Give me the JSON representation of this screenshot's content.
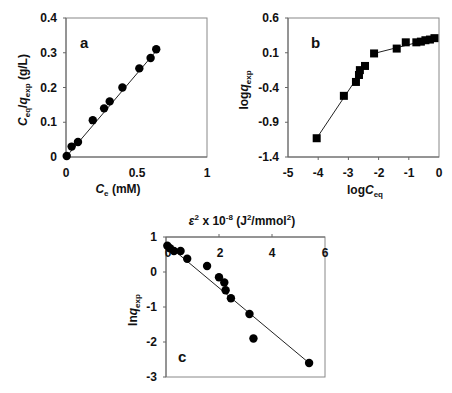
{
  "chart_data": [
    {
      "id": "a",
      "type": "scatter",
      "panel_label": "a",
      "xlabel": "C_e (mM)",
      "ylabel": "C_eq/q_exp (g/L)",
      "xlim": [
        0,
        1
      ],
      "ylim": [
        0,
        0.4
      ],
      "xticks": [
        "0",
        "0.5",
        "1"
      ],
      "yticks": [
        "0",
        "0.1",
        "0.2",
        "0.3",
        "0.4"
      ],
      "grid": false,
      "marker": "circle",
      "x": [
        0.005,
        0.04,
        0.085,
        0.19,
        0.27,
        0.31,
        0.4,
        0.52,
        0.6,
        0.64
      ],
      "y": [
        0.003,
        0.03,
        0.043,
        0.106,
        0.14,
        0.16,
        0.2,
        0.255,
        0.285,
        0.31
      ],
      "fit_line": {
        "x": [
          0,
          0.65
        ],
        "y": [
          0.0,
          0.31
        ]
      }
    },
    {
      "id": "b",
      "type": "line",
      "panel_label": "b",
      "xlabel": "logC_eq",
      "ylabel": "logq_exp",
      "xlim": [
        -5,
        0
      ],
      "ylim": [
        -1.4,
        0.6
      ],
      "xticks": [
        "-5",
        "-4",
        "-3",
        "-2",
        "-1",
        "0"
      ],
      "yticks": [
        "-1.4",
        "-0.9",
        "-0.4",
        "0.1",
        "0.6"
      ],
      "grid": false,
      "marker": "square",
      "x": [
        -4.05,
        -3.15,
        -2.75,
        -2.65,
        -2.62,
        -2.45,
        -2.15,
        -1.4,
        -1.1,
        -0.75,
        -0.6,
        -0.45,
        -0.3,
        -0.15
      ],
      "y": [
        -1.13,
        -0.52,
        -0.32,
        -0.22,
        -0.15,
        -0.09,
        0.09,
        0.16,
        0.25,
        0.25,
        0.26,
        0.28,
        0.29,
        0.31
      ],
      "fit_segments": [
        {
          "x": [
            -4.05,
            -2.45
          ],
          "y": [
            -1.13,
            -0.09
          ]
        },
        {
          "x": [
            -2.15,
            -0.15
          ],
          "y": [
            0.09,
            0.31
          ]
        }
      ]
    },
    {
      "id": "c",
      "type": "scatter",
      "panel_label": "c",
      "xlabel": "ε² x 10⁻⁸ (J²/mmol²)",
      "ylabel": "lnq_exp",
      "xlabel_position": "top",
      "xlim": [
        0,
        6
      ],
      "ylim": [
        -3,
        1
      ],
      "xticks": [
        "0",
        "2",
        "4",
        "6"
      ],
      "yticks": [
        "-3",
        "-2",
        "-1",
        "0",
        "1"
      ],
      "grid": false,
      "marker": "circle",
      "x": [
        0.05,
        0.15,
        0.3,
        0.55,
        0.8,
        1.55,
        2.0,
        2.2,
        2.25,
        2.45,
        3.15,
        3.3,
        5.4
      ],
      "y": [
        0.75,
        0.68,
        0.6,
        0.6,
        0.38,
        0.17,
        -0.15,
        -0.3,
        -0.52,
        -0.75,
        -1.2,
        -1.9,
        -2.6
      ],
      "fit_line": {
        "x": [
          0.05,
          5.4
        ],
        "y": [
          0.78,
          -2.6
        ]
      }
    }
  ],
  "labels": {
    "a": {
      "panel": "a",
      "x_main": "C",
      "x_sub": "e",
      "x_unit": " (mM)",
      "y_main1": "C",
      "y_sub1": "eq",
      "y_slash": "/",
      "y_main2": "q",
      "y_sub2": "exp",
      "y_unit": " (g/L)",
      "xticks": [
        "0",
        "0.5",
        "1"
      ],
      "yticks": [
        "0",
        "0.1",
        "0.2",
        "0.3",
        "0.4"
      ]
    },
    "b": {
      "panel": "b",
      "x_pre": "log",
      "x_main": "C",
      "x_sub": "eq",
      "y_pre": "log",
      "y_main": "q",
      "y_sub": "exp",
      "xticks": [
        "-5",
        "-4",
        "-3",
        "-2",
        "-1",
        "0"
      ],
      "yticks": [
        "0.6",
        "0.1",
        "-0.4",
        "-0.9",
        "-1.4"
      ]
    },
    "c": {
      "panel": "c",
      "x_eps": "ε",
      "x_sup1": "2",
      "x_mid": " x 10",
      "x_sup2": "-8",
      "x_unit1": " (J",
      "x_sup3": "2",
      "x_unit2": "/mmol",
      "x_sup4": "2",
      "x_unit3": ")",
      "y_pre": "ln",
      "y_main": "q",
      "y_sub": "exp",
      "xticks": [
        "0",
        "2",
        "4",
        "6"
      ],
      "yticks": [
        "1",
        "0",
        "-1",
        "-2",
        "-3"
      ]
    }
  }
}
